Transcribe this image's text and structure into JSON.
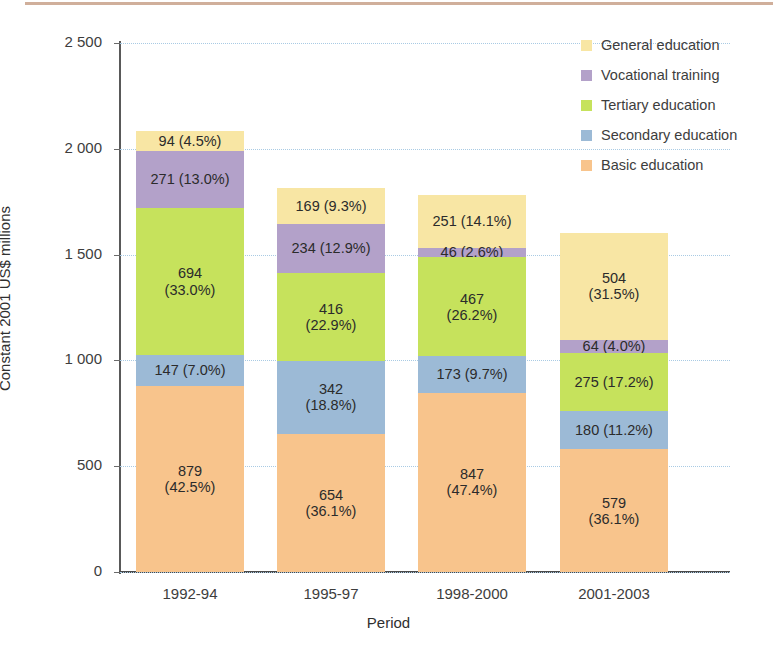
{
  "chart_data": {
    "type": "bar",
    "stacked": true,
    "title": "",
    "xlabel": "Period",
    "ylabel": "Constant 2001 US$ millions",
    "categories": [
      "1992-94",
      "1995-97",
      "1998-2000",
      "2001-2003"
    ],
    "ylim": [
      0,
      2500
    ],
    "yticks": [
      0,
      500,
      1000,
      1500,
      2000,
      2500
    ],
    "ytick_labels": [
      "0",
      "500",
      "1 000",
      "1 500",
      "2 000",
      "2 500"
    ],
    "grid": true,
    "legend_position": "top-right",
    "series": [
      {
        "name": "Basic education",
        "color": "#f8c48c",
        "values": [
          879,
          654,
          847,
          579
        ],
        "percents": [
          "42.5%",
          "36.1%",
          "47.4%",
          "36.1%"
        ],
        "labels": [
          "879\n(42.5%)",
          "654\n(36.1%)",
          "847\n(47.4%)",
          "579\n(36.1%)"
        ]
      },
      {
        "name": "Secondary education",
        "color": "#9cbad6",
        "values": [
          147,
          342,
          173,
          180
        ],
        "percents": [
          "7.0%",
          "18.8%",
          "9.7%",
          "11.2%"
        ],
        "labels": [
          "147 (7.0%)",
          "342\n(18.8%)",
          "173 (9.7%)",
          "180 (11.2%)"
        ]
      },
      {
        "name": "Tertiary education",
        "color": "#c6e25c",
        "values": [
          694,
          416,
          467,
          275
        ],
        "percents": [
          "33.0%",
          "22.9%",
          "26.2%",
          "17.2%"
        ],
        "labels": [
          "694\n(33.0%)",
          "416\n(22.9%)",
          "467\n(26.2%)",
          "275 (17.2%)"
        ]
      },
      {
        "name": "Vocational training",
        "color": "#b3a1c9",
        "values": [
          271,
          234,
          46,
          64
        ],
        "percents": [
          "13.0%",
          "12.9%",
          "2.6%",
          "4.0%"
        ],
        "labels": [
          "271 (13.0%)",
          "234 (12.9%)",
          "46 (2.6%)",
          "64 (4.0%)"
        ]
      },
      {
        "name": "General education",
        "color": "#f8e6a4",
        "values": [
          94,
          169,
          251,
          504
        ],
        "percents": [
          "4.5%",
          "9.3%",
          "14.1%",
          "31.5%"
        ],
        "labels": [
          "94 (4.5%)",
          "169 (9.3%)",
          "251 (14.1%)",
          "504\n(31.5%)"
        ]
      }
    ],
    "totals": [
      2085,
      1815,
      1784,
      1602
    ]
  },
  "axes": {
    "y_title": "Constant 2001 US$ millions",
    "x_title": "Period",
    "ytick_0": "0",
    "ytick_1": "500",
    "ytick_2": "1 000",
    "ytick_3": "1 500",
    "ytick_4": "2 000",
    "ytick_5": "2 500",
    "xtick_0": "1992-94",
    "xtick_1": "1995-97",
    "xtick_2": "1998-2000",
    "xtick_3": "2001-2003"
  },
  "legend": {
    "items": [
      {
        "label": "General education",
        "color": "#f8e6a4"
      },
      {
        "label": "Vocational training",
        "color": "#b3a1c9"
      },
      {
        "label": "Tertiary education",
        "color": "#c6e25c"
      },
      {
        "label": "Secondary education",
        "color": "#9cbad6"
      },
      {
        "label": "Basic education",
        "color": "#f8c48c"
      }
    ]
  },
  "bar_labels": {
    "b0s0": "879\n(42.5%)",
    "b0s1": "147 (7.0%)",
    "b0s2": "694\n(33.0%)",
    "b0s3": "271 (13.0%)",
    "b0s4": "94 (4.5%)",
    "b1s0": "654\n(36.1%)",
    "b1s1": "342\n(18.8%)",
    "b1s2": "416\n(22.9%)",
    "b1s3": "234 (12.9%)",
    "b1s4": "169 (9.3%)",
    "b2s0": "847\n(47.4%)",
    "b2s1": "173 (9.7%)",
    "b2s2": "467\n(26.2%)",
    "b2s3": "46 (2.6%)",
    "b2s4": "251 (14.1%)",
    "b3s0": "579\n(36.1%)",
    "b3s1": "180 (11.2%)",
    "b3s2": "275 (17.2%)",
    "b3s3": "64 (4.0%)",
    "b3s4": "504\n(31.5%)"
  }
}
